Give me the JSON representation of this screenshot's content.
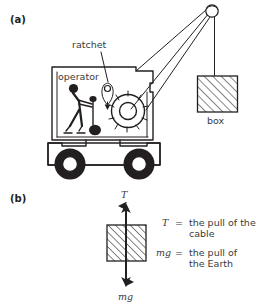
{
  "figure": {
    "title_a": "(a)",
    "title_b": "(b)",
    "background_color": "#ffffff",
    "ink_color": "#231f20"
  },
  "panel_a": {
    "label": "(a)",
    "callouts": [
      {
        "name": "ratchet",
        "text": "ratchet"
      },
      {
        "name": "operator",
        "text": "operator"
      },
      {
        "name": "box",
        "text": "box"
      }
    ],
    "ratchet_label": "ratchet",
    "operator_label": "operator",
    "box_label": "box",
    "scene_description": "mobile crane with operator in cab, ratchet and winch drum, boom with pulley, hanging hatched box"
  },
  "panel_b": {
    "label": "(b)",
    "tension_symbol": "T",
    "weight_symbol": "mg",
    "legend": [
      {
        "symbol": "T",
        "equals": "=",
        "line1": "the pull of the",
        "line2": "cable"
      },
      {
        "symbol": "mg",
        "equals": "=",
        "line1": "the pull of",
        "line2": "the Earth"
      }
    ],
    "legend_t_symbol": "T",
    "legend_t_equals": "=",
    "legend_t_line1": "the pull of the",
    "legend_t_line2": "cable",
    "legend_mg_symbol": "mg",
    "legend_mg_equals": "=",
    "legend_mg_line1": "the pull of",
    "legend_mg_line2": "the Earth",
    "body_description": "free-body diagram: hatched block with upward tension arrow T and downward weight arrow mg"
  }
}
